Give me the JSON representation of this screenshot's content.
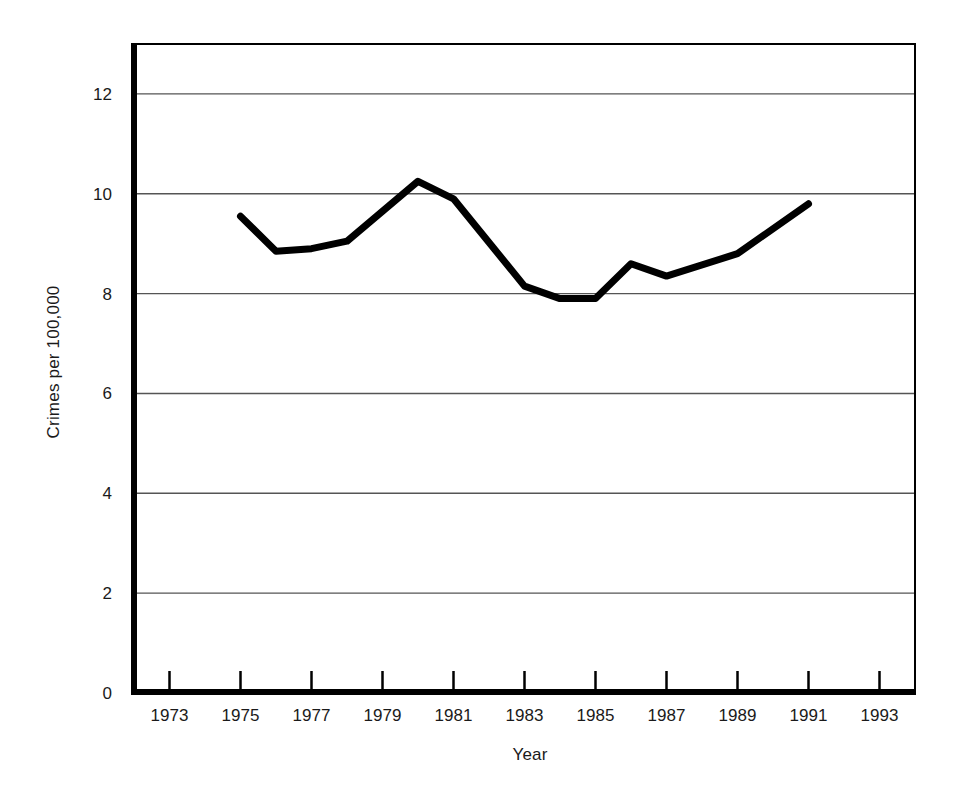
{
  "chart_data": {
    "type": "line",
    "title": "",
    "subtitle": "",
    "xlabel": "Year",
    "ylabel": "Crimes per 100,000",
    "x": [
      1975,
      1976,
      1977,
      1978,
      1980,
      1981,
      1983,
      1984,
      1985,
      1986,
      1987,
      1989,
      1991
    ],
    "values": [
      9.55,
      8.85,
      8.9,
      9.05,
      10.25,
      9.9,
      8.15,
      7.9,
      7.9,
      8.6,
      8.35,
      8.8,
      9.8
    ],
    "series": [
      {
        "name": "Crimes per 100,000",
        "values": [
          9.55,
          8.85,
          8.9,
          9.05,
          10.25,
          9.9,
          8.15,
          7.9,
          7.9,
          8.6,
          8.35,
          8.8,
          9.8
        ]
      }
    ],
    "xlim": [
      1972,
      1994
    ],
    "ylim": [
      0,
      13
    ],
    "xticks": [
      1973,
      1975,
      1977,
      1979,
      1981,
      1983,
      1985,
      1987,
      1989,
      1991,
      1993
    ],
    "xtick_labels": [
      "1973",
      "1975",
      "1977",
      "1979",
      "1981",
      "1983",
      "1985",
      "1987",
      "1989",
      "1991",
      "1993"
    ],
    "yticks": [
      0,
      2,
      4,
      6,
      8,
      10,
      12
    ],
    "ytick_labels": [
      "0",
      "2",
      "4",
      "6",
      "8",
      "10",
      "12"
    ],
    "grid": "horizontal",
    "legend": "none",
    "line_color": "#000000",
    "grid_color": "#555555",
    "axis_color": "#000000",
    "background": "#ffffff"
  },
  "axes": {
    "y_title": "Crimes per 100,000",
    "x_title": "Year"
  }
}
